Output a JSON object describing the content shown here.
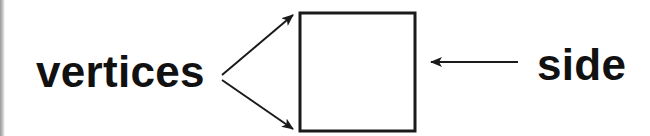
{
  "diagram": {
    "labels": {
      "vertices": "vertices",
      "side": "side"
    },
    "shape": {
      "type": "square",
      "x": 299,
      "y": 12,
      "width": 117,
      "height": 120,
      "stroke": "#1a1a1a"
    },
    "arrows": [
      {
        "name": "vertex-arrow-top",
        "from": [
          222,
          75
        ],
        "to": [
          294,
          14
        ]
      },
      {
        "name": "vertex-arrow-bottom",
        "from": [
          222,
          80
        ],
        "to": [
          294,
          130
        ]
      },
      {
        "name": "side-arrow",
        "from": [
          518,
          62
        ],
        "to": [
          430,
          62
        ]
      }
    ],
    "colors": {
      "ink": "#111111",
      "background": "#ffffff"
    }
  }
}
